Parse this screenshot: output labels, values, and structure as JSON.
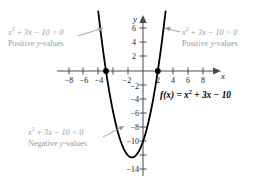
{
  "chart_data": {
    "type": "line",
    "title": "",
    "function_label": "f(x) = x² + 3x − 10",
    "equation": "y = x^2 + 3x - 10",
    "xlabel": "x",
    "ylabel": "y",
    "xlim": [
      -9.5,
      9.5
    ],
    "ylim": [
      -15,
      7.5
    ],
    "grid": false,
    "legend": "none",
    "x_ticks": [
      -8,
      -6,
      -4,
      -2,
      2,
      4,
      6,
      8
    ],
    "x_tick_labels": [
      "−8",
      "−6",
      "−4",
      "−2",
      "2",
      "4",
      "6",
      "8"
    ],
    "y_ticks": [
      6,
      4,
      2,
      -2,
      -4,
      -6,
      -8,
      -10,
      -14
    ],
    "y_tick_labels": [
      "6",
      "4",
      "2",
      "−2",
      "−4",
      "−6",
      "−8",
      "−10",
      "−14"
    ],
    "roots": [
      -5,
      2
    ],
    "root_points": [
      {
        "x": -5,
        "y": 0
      },
      {
        "x": 2,
        "y": 0
      }
    ],
    "vertex": {
      "x": -1.5,
      "y": -12.25
    },
    "y_intercept": -10,
    "curve_color": "#000000",
    "axis_color": "#4a4a4a",
    "annotation_color": "#9a9a9a",
    "x": [
      -6.2,
      -6.0,
      -5.5,
      -5.0,
      -4.5,
      -4.0,
      -3.5,
      -3.0,
      -2.5,
      -2.0,
      -1.5,
      -1.0,
      -0.5,
      0.0,
      0.5,
      1.0,
      1.5,
      2.0,
      2.5,
      3.0,
      3.2
    ],
    "y": [
      9.04,
      8.0,
      3.75,
      0.0,
      -3.25,
      -6.0,
      -8.25,
      -10.0,
      -11.25,
      -12.0,
      -12.25,
      -12.0,
      -11.25,
      -10.0,
      -8.25,
      -6.0,
      -3.25,
      0.0,
      3.75,
      8.0,
      9.84
    ]
  },
  "annotations": {
    "left": {
      "inequality_lhs": "x",
      "inequality_exp": "2",
      "inequality_rest": " + 3x − 10 > 0",
      "caption_pre": "Positive ",
      "caption_var": "y",
      "caption_post": "-values"
    },
    "right": {
      "inequality_lhs": "x",
      "inequality_exp": "2",
      "inequality_rest": " + 3x − 10 > 0",
      "caption_pre": "Positive ",
      "caption_var": "y",
      "caption_post": "-values"
    },
    "bottom": {
      "inequality_lhs": "x",
      "inequality_exp": "2",
      "inequality_rest": " + 3x − 10 < 0",
      "caption_pre": "Negative ",
      "caption_var": "y",
      "caption_post": "-values"
    }
  },
  "function_label": {
    "prefix": "f",
    "arg": "(x)",
    "equals": " = ",
    "term_var": "x",
    "term_exp": "2",
    "term_rest": " + 3x − 10"
  }
}
